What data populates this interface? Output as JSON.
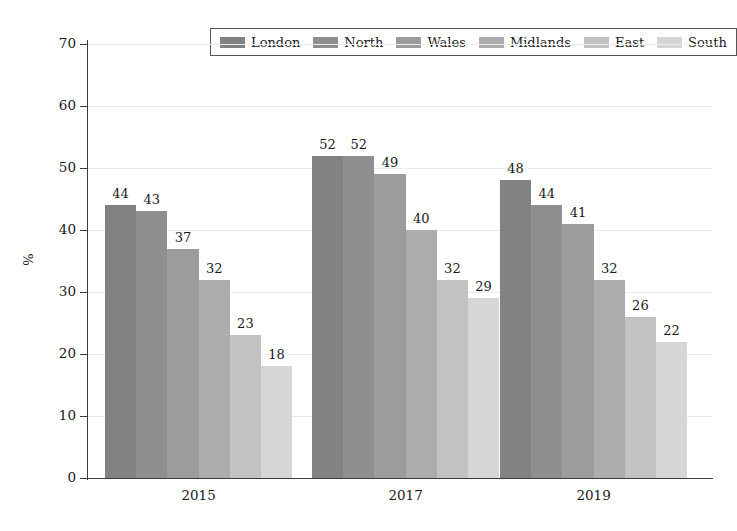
{
  "chart_data": {
    "type": "bar",
    "title": "",
    "subtitle": "",
    "xlabel": "",
    "ylabel": "%",
    "categories": [
      "2015",
      "2017",
      "2019"
    ],
    "ylim": [
      0,
      70
    ],
    "yticks": [
      0,
      10,
      20,
      30,
      40,
      50,
      60,
      70
    ],
    "ytick_labels": [
      "0",
      "10",
      "20",
      "30",
      "40",
      "50",
      "60",
      "70"
    ],
    "grid": true,
    "legend_position": "top-center",
    "series": [
      {
        "name": "London",
        "color": "#828282",
        "values": [
          44,
          52,
          48
        ]
      },
      {
        "name": "North",
        "color": "#8f8f8f",
        "values": [
          43,
          52,
          44
        ]
      },
      {
        "name": "Wales",
        "color": "#9c9c9c",
        "values": [
          37,
          49,
          41
        ]
      },
      {
        "name": "Midlands",
        "color": "#acacac",
        "values": [
          32,
          40,
          32
        ]
      },
      {
        "name": "East",
        "color": "#c2c2c2",
        "values": [
          23,
          32,
          26
        ]
      },
      {
        "name": "South",
        "color": "#d6d6d6",
        "values": [
          18,
          29,
          22
        ]
      }
    ]
  }
}
